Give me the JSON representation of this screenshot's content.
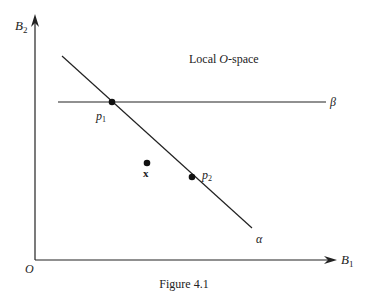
{
  "figure": {
    "caption": "Figure 4.1",
    "region_label_prefix": "Local ",
    "region_label_italic": "O",
    "region_label_suffix": "-space"
  },
  "axes": {
    "x_label_main": "B",
    "x_label_sub": "1",
    "y_label_main": "B",
    "y_label_sub": "2",
    "origin_label": "O"
  },
  "lines": {
    "alpha": {
      "label": "α"
    },
    "beta": {
      "label": "β"
    }
  },
  "points": {
    "p1": {
      "main": "p",
      "sub": "1"
    },
    "p2": {
      "main": "p",
      "sub": "2"
    },
    "x": {
      "label": "x"
    }
  },
  "colors": {
    "ink": "#222222",
    "background": "#ffffff"
  }
}
